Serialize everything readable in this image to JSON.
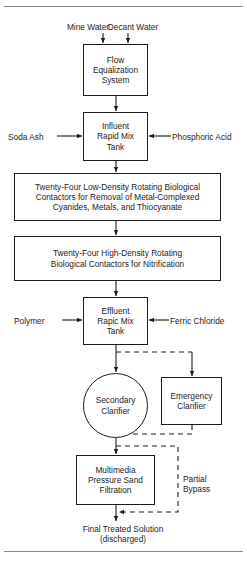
{
  "figure": {
    "line_color": "#1c1c1c",
    "rule_color": "#8a8a8a",
    "background": "#ffffff"
  },
  "inputs": {
    "mine_water": "Mine Water",
    "decant_water": "Decant Water",
    "soda_ash": "Soda Ash",
    "phosphoric_acid": "Phosphoric Acid",
    "polymer": "Polymer",
    "ferric_chloride": "Ferric Chloride"
  },
  "nodes": {
    "flow_equalization": {
      "shape": "rectangle",
      "lines": [
        "Flow",
        "Equalization",
        "System"
      ]
    },
    "influent_rapid_mix": {
      "shape": "rectangle",
      "lines": [
        "Influent",
        "Rapid Mix",
        "Tank"
      ]
    },
    "rbc_low_density": {
      "shape": "rectangle",
      "lines": [
        "Twenty-Four Low-Density Rotating Biological",
        "Contactors for Removal of Metal-Complexed",
        "Cyanides, Metals, and Thiocyanate"
      ]
    },
    "rbc_high_density": {
      "shape": "rectangle",
      "lines": [
        "Twenty-Four High-Density Rotating",
        "Biological Contactors for Nitrification"
      ]
    },
    "effluent_rapid_mix": {
      "shape": "rectangle",
      "lines": [
        "Effluent",
        "Rapic Mix",
        "Tank"
      ]
    },
    "secondary_clarifier": {
      "shape": "circle",
      "lines": [
        "Secondary",
        "Clarifier"
      ]
    },
    "emergency_clarifier": {
      "shape": "rectangle",
      "lines": [
        "Emergency",
        "Clarifier"
      ]
    },
    "multimedia_filter": {
      "shape": "rectangle",
      "lines": [
        "Multimedia",
        "Pressure Sand",
        "Filtration"
      ]
    }
  },
  "annotations": {
    "partial_bypass": [
      "Partial",
      "Bypass"
    ],
    "final_output": [
      "Final Treated Solution",
      "(discharged)"
    ]
  }
}
